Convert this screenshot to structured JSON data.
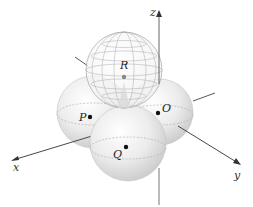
{
  "diagram": {
    "axes": {
      "x": "x",
      "y": "y",
      "z": "z"
    },
    "spheres": [
      {
        "id": "P",
        "label": "P",
        "style": "solid"
      },
      {
        "id": "O",
        "label": "O",
        "style": "solid"
      },
      {
        "id": "Q",
        "label": "Q",
        "style": "solid"
      },
      {
        "id": "R",
        "label": "R",
        "style": "wireframe"
      }
    ]
  }
}
